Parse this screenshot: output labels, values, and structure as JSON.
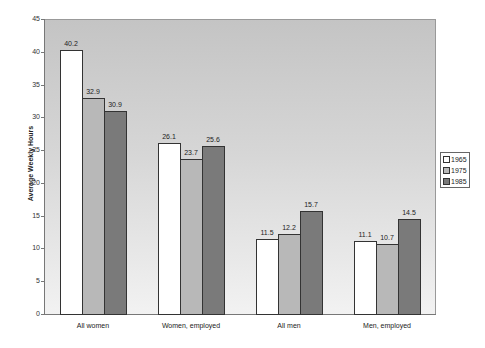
{
  "chart_data": {
    "type": "bar",
    "title": "",
    "xlabel": "",
    "ylabel": "Average Weekly Hours",
    "ylim": [
      0,
      45
    ],
    "yticks": [
      0,
      5,
      10,
      15,
      20,
      25,
      30,
      35,
      40,
      45
    ],
    "categories": [
      "All women",
      "Women, employed",
      "All men",
      "Men, employed"
    ],
    "series": [
      {
        "name": "1965",
        "color": "#ffffff",
        "values": [
          40.2,
          26.1,
          11.5,
          11.1
        ]
      },
      {
        "name": "1975",
        "color": "#b8b8b8",
        "values": [
          32.9,
          23.7,
          12.2,
          10.7
        ]
      },
      {
        "name": "1985",
        "color": "#7a7a7a",
        "values": [
          30.9,
          25.6,
          15.7,
          14.5
        ]
      }
    ],
    "data_labels": true,
    "grid": false,
    "legend_position": "right"
  }
}
